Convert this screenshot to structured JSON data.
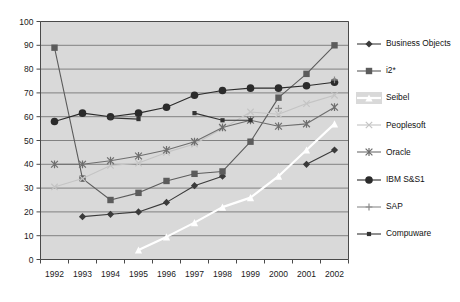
{
  "chart_data": {
    "type": "line",
    "title": "",
    "xlabel": "",
    "ylabel": "",
    "categories": [
      "1992",
      "1993",
      "1994",
      "1995",
      "1996",
      "1997",
      "1998",
      "1999",
      "2000",
      "2001",
      "2002"
    ],
    "x": [
      1992,
      1993,
      1994,
      1995,
      1996,
      1997,
      1998,
      1999,
      2000,
      2001,
      2002
    ],
    "ylim": [
      0,
      100
    ],
    "yticks": [
      0,
      10,
      20,
      30,
      40,
      50,
      60,
      70,
      80,
      90,
      100
    ],
    "grid": true,
    "legend_position": "right",
    "plot_background": "#d9d9d9",
    "series": [
      {
        "name": "Business Objects",
        "marker": "diamond",
        "color": "#3a3a3a",
        "values": [
          null,
          18,
          19,
          20,
          24,
          31,
          35,
          null,
          null,
          40,
          46
        ]
      },
      {
        "name": "i2*",
        "marker": "square",
        "color": "#5c5c5c",
        "values": [
          89,
          34,
          25,
          28,
          33,
          36,
          37,
          49.5,
          68,
          78,
          90
        ]
      },
      {
        "name": "Seibel",
        "marker": "triangle",
        "color": "#ffffff",
        "values": [
          null,
          null,
          null,
          4,
          9.5,
          15.5,
          22,
          26,
          35,
          46,
          57
        ]
      },
      {
        "name": "Peoplesoft",
        "marker": "x",
        "color": "#c4c4c4",
        "values": [
          30.5,
          34,
          39.5,
          40.5,
          45,
          48.5,
          55,
          62,
          61,
          65.5,
          69
        ]
      },
      {
        "name": "Oracle",
        "marker": "star",
        "color": "#6e6e6e",
        "values": [
          40,
          40,
          41.5,
          43.5,
          46,
          49.5,
          55.5,
          58.5,
          56,
          57,
          64
        ]
      },
      {
        "name": "IBM S&S1",
        "marker": "circle",
        "color": "#2b2b2b",
        "values": [
          58,
          61.5,
          60,
          61.5,
          64,
          69,
          71,
          72,
          72,
          73,
          74.5
        ]
      },
      {
        "name": "SAP",
        "marker": "plus",
        "color": "#8a8a8a",
        "values": [
          null,
          null,
          null,
          null,
          null,
          null,
          null,
          null,
          63.5,
          null,
          75.5
        ]
      },
      {
        "name": "Compuware",
        "marker": "small-square",
        "color": "#333333",
        "values": [
          null,
          null,
          59.5,
          59,
          null,
          61.5,
          58.5,
          58.5,
          null,
          null,
          null
        ]
      }
    ]
  },
  "legend": {
    "items": [
      {
        "label": "Business Objects",
        "key": "diamond-marker-icon"
      },
      {
        "label": "i2*",
        "key": "square-marker-icon"
      },
      {
        "label": "Seibel",
        "key": "triangle-marker-icon"
      },
      {
        "label": "Peoplesoft",
        "key": "x-marker-icon"
      },
      {
        "label": "Oracle",
        "key": "star-marker-icon"
      },
      {
        "label": "IBM S&S1",
        "key": "circle-marker-icon"
      },
      {
        "label": "SAP",
        "key": "plus-marker-icon"
      },
      {
        "label": "Compuware",
        "key": "small-square-marker-icon"
      }
    ]
  }
}
